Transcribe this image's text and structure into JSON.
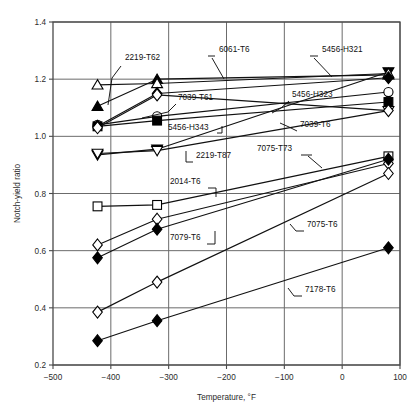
{
  "chart_data": {
    "type": "line",
    "title": "",
    "xlabel": "Temperature, °F",
    "ylabel": "Notch-yield ratio",
    "xlim": [
      -500,
      100
    ],
    "ylim": [
      0.2,
      1.4
    ],
    "xticks": [
      -500,
      -400,
      -300,
      -200,
      -100,
      0,
      100
    ],
    "xtick_labels": [
      "−500",
      "−400",
      "−300",
      "−200",
      "−100",
      "0",
      "100"
    ],
    "yticks": [
      0.2,
      0.4,
      0.6,
      0.8,
      1.0,
      1.2,
      1.4
    ],
    "ytick_labels": [
      "0.2",
      "0.4",
      "0.6",
      "0.8",
      "1.0",
      "1.2",
      "1.4"
    ],
    "grid": true,
    "legend_position": "inline-annotations",
    "x": [
      -423,
      -320,
      80
    ],
    "series": [
      {
        "name": "5456-H321",
        "marker": "triangle-down-filled",
        "values": [
          0.935,
          0.955,
          1.225
        ]
      },
      {
        "name": "6061-T6",
        "marker": "triangle-up-filled",
        "values": [
          1.105,
          1.2,
          1.215
        ]
      },
      {
        "name": "2219-T62",
        "marker": "triangle-up-open",
        "values": [
          1.18,
          1.185,
          1.22
        ]
      },
      {
        "name": "5456-H323",
        "marker": "circle-open",
        "values": [
          1.04,
          1.07,
          1.155
        ]
      },
      {
        "name": "7039-T61",
        "marker": "diamond-filled",
        "values": [
          1.035,
          1.15,
          1.205
        ]
      },
      {
        "name": "5456-H343",
        "marker": "square-filled",
        "values": [
          1.035,
          1.055,
          1.12
        ]
      },
      {
        "name": "2219-T87",
        "marker": "triangle-down-open",
        "values": [
          0.94,
          0.95,
          1.09
        ]
      },
      {
        "name": "7039-T6",
        "marker": "diamond-open",
        "values": [
          1.03,
          1.145,
          1.09
        ]
      },
      {
        "name": "2014-T6",
        "marker": "square-open",
        "values": [
          0.755,
          0.76,
          0.93
        ]
      },
      {
        "name": "7075-T73",
        "marker": "diamond-open-2",
        "values": [
          0.62,
          0.71,
          0.905
        ]
      },
      {
        "name": "7075-T6",
        "marker": "diamond-filled-2",
        "values": [
          0.575,
          0.675,
          0.92
        ]
      },
      {
        "name": "7079-T6",
        "marker": "diamond-open-3",
        "values": [
          0.385,
          0.49,
          0.87
        ]
      },
      {
        "name": "7178-T6",
        "marker": "diamond-filled-3",
        "values": [
          0.285,
          0.355,
          0.61
        ]
      }
    ],
    "annotations": [
      {
        "label": "2219-T62",
        "x": 125,
        "y": 60
      },
      {
        "label": "6061-T6",
        "x": 219,
        "y": 52
      },
      {
        "label": "5456-H321",
        "x": 322,
        "y": 52
      },
      {
        "label": "7039-T61",
        "x": 178,
        "y": 100
      },
      {
        "label": "5456-H323",
        "x": 292,
        "y": 97
      },
      {
        "label": "5456-H343",
        "x": 168,
        "y": 130
      },
      {
        "label": "7039-T6",
        "x": 300,
        "y": 127
      },
      {
        "label": "2219-T87",
        "x": 196,
        "y": 158
      },
      {
        "label": "7075-T73",
        "x": 257,
        "y": 151
      },
      {
        "label": "2014-T6",
        "x": 170,
        "y": 184
      },
      {
        "label": "7079-T6",
        "x": 170,
        "y": 240
      },
      {
        "label": "7075-T6",
        "x": 307,
        "y": 227
      },
      {
        "label": "7178-T6",
        "x": 305,
        "y": 292
      }
    ]
  }
}
